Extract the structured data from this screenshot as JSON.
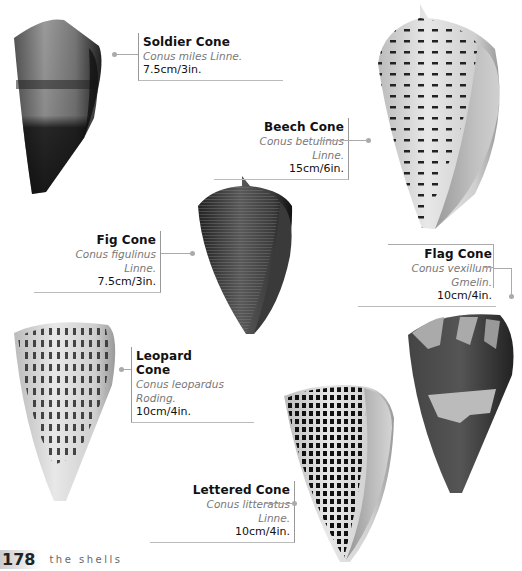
{
  "shells": [
    {
      "id": "soldier",
      "name": "Soldier Cone",
      "scientific": "Conus miles Linne.",
      "size": "7.5cm/3in."
    },
    {
      "id": "beech",
      "name": "Beech Cone",
      "scientific": "Conus betulinus Linne.",
      "size": "15cm/6in."
    },
    {
      "id": "fig",
      "name": "Fig Cone",
      "scientific": "Conus figulinus Linne.",
      "size": "7.5cm/3in."
    },
    {
      "id": "flag",
      "name": "Flag Cone",
      "scientific": "Conus vexillum Gmelin.",
      "size": "10cm/4in."
    },
    {
      "id": "leopard",
      "name": "Leopard Cone",
      "scientific": "Conus leopardus Roding.",
      "size": "10cm/4in."
    },
    {
      "id": "lettered",
      "name": "Lettered Cone",
      "scientific": "Conus litteratus Linne.",
      "size": "10cm/4in."
    }
  ],
  "footer": {
    "page_number": "178",
    "running_head": "the shells"
  },
  "colors": {
    "leader": "#aaaaaa",
    "text": "#111111",
    "scientific": "#777777"
  }
}
